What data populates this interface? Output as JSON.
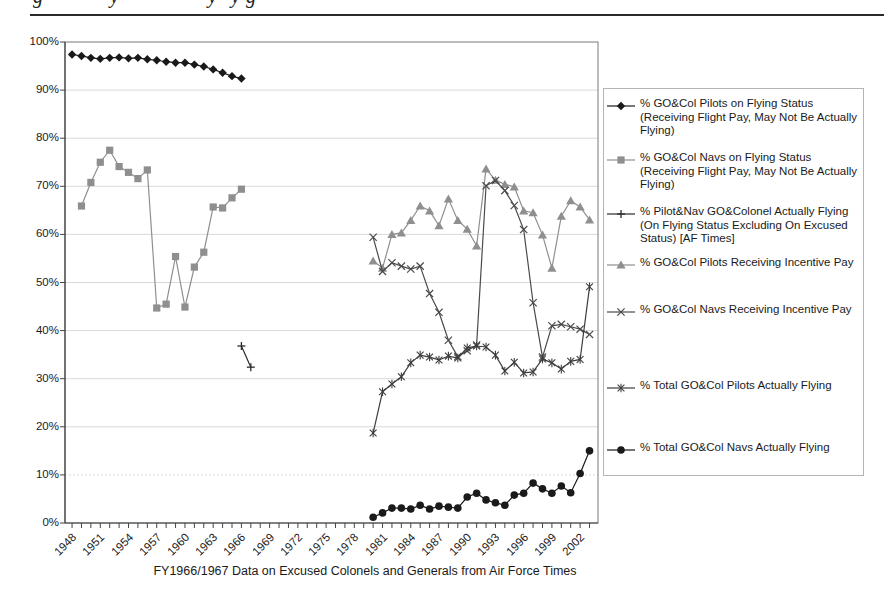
{
  "header": {
    "fragments": [
      {
        "char": "g",
        "x": 33
      },
      {
        "char": "y",
        "x": 110
      },
      {
        "char": "y",
        "x": 208
      },
      {
        "char": "y",
        "x": 231
      },
      {
        "char": "g",
        "x": 246
      }
    ]
  },
  "chart_data": {
    "type": "line",
    "title": "",
    "xlabel": "FY1966/1967 Data on Excused Colonels and Generals from Air Force Times",
    "ylabel": "",
    "ylim": [
      0,
      100
    ],
    "xlim": [
      1947.25,
      2003.9
    ],
    "grid": "horizontal, light gray, dotted at 10%",
    "legend_position": "right",
    "y_tick_step": 10,
    "y_tick_labels": [
      "0%",
      "10%",
      "20%",
      "30%",
      "40%",
      "50%",
      "60%",
      "70%",
      "80%",
      "90%",
      "100%"
    ],
    "x_tick_labels": [
      "1948",
      "1951",
      "1954",
      "1957",
      "1960",
      "1963",
      "1966",
      "1969",
      "1972",
      "1975",
      "1978",
      "1981",
      "1984",
      "1987",
      "1990",
      "1993",
      "1996",
      "1999",
      "2002"
    ],
    "series": [
      {
        "name": "% GO&Col Pilots on Flying Status (Receiving Flight Pay, May Not Be Actually Flying)",
        "marker": "diamond",
        "color": "#1a1a1a",
        "x": [
          1948,
          1949,
          1950,
          1951,
          1952,
          1953,
          1954,
          1955,
          1956,
          1957,
          1958,
          1959,
          1960,
          1961,
          1962,
          1963,
          1964,
          1965,
          1966
        ],
        "y": [
          97.4,
          97.1,
          96.7,
          96.5,
          96.7,
          96.8,
          96.6,
          96.7,
          96.4,
          96.2,
          95.9,
          95.7,
          95.7,
          95.3,
          94.9,
          94.3,
          93.6,
          92.9,
          92.4
        ]
      },
      {
        "name": "% GO&Col Navs on Flying Status (Receiving Flight Pay, May Not Be Actually Flying)",
        "marker": "square",
        "color": "#8f8f8f",
        "x": [
          1949,
          1950,
          1951,
          1952,
          1953,
          1954,
          1955,
          1956,
          1957,
          1958,
          1959,
          1960,
          1961,
          1962,
          1963,
          1964,
          1965,
          1966
        ],
        "y": [
          65.9,
          70.8,
          75.0,
          77.5,
          74.1,
          72.9,
          71.6,
          73.4,
          44.7,
          45.5,
          55.4,
          44.9,
          53.2,
          56.3,
          65.7,
          65.5,
          67.6,
          69.4
        ]
      },
      {
        "name": "% Pilot&Nav GO&Colonel Actually Flying (On Flying Status Excluding On Excused Status) [AF Times]",
        "marker": "plus",
        "color": "#2b2b2b",
        "x": [
          1966,
          1967
        ],
        "y": [
          36.8,
          32.4
        ]
      },
      {
        "name": "% GO&Col Pilots Receiving Incentive Pay",
        "marker": "triangle",
        "color": "#8f8f8f",
        "x": [
          1980,
          1981,
          1982,
          1983,
          1984,
          1985,
          1986,
          1987,
          1988,
          1989,
          1990,
          1991,
          1992,
          1993,
          1994,
          1995,
          1996,
          1997,
          1998,
          1999,
          2000,
          2001,
          2002,
          2003
        ],
        "y": [
          54.5,
          53.0,
          60.0,
          60.3,
          62.9,
          65.9,
          64.9,
          61.8,
          67.4,
          62.9,
          61.1,
          57.6,
          73.6,
          71.3,
          70.4,
          69.9,
          64.9,
          64.5,
          59.9,
          53.0,
          63.8,
          67.0,
          65.7,
          63.0
        ]
      },
      {
        "name": "% GO&Col Navs Receiving Incentive Pay",
        "marker": "x",
        "color": "#4a4a4a",
        "x": [
          1980,
          1981,
          1982,
          1983,
          1984,
          1985,
          1986,
          1987,
          1988,
          1989,
          1990,
          1991,
          1992,
          1993,
          1994,
          1995,
          1996,
          1997,
          1998,
          1999,
          2000,
          2001,
          2002,
          2003
        ],
        "y": [
          59.4,
          52.3,
          54.1,
          53.4,
          52.8,
          53.4,
          47.7,
          43.8,
          38.0,
          34.6,
          35.8,
          37.0,
          70.1,
          71.2,
          69.1,
          66.0,
          61.0,
          45.8,
          34.5,
          41.0,
          41.3,
          40.8,
          40.3,
          39.2
        ]
      },
      {
        "name": "% Total GO&Col Pilots Actually Flying",
        "marker": "asterisk",
        "color": "#3d3d3d",
        "x": [
          1980,
          1981,
          1982,
          1983,
          1984,
          1985,
          1986,
          1987,
          1988,
          1989,
          1990,
          1991,
          1992,
          1993,
          1994,
          1995,
          1996,
          1997,
          1998,
          1999,
          2000,
          2001,
          2002,
          2003
        ],
        "y": [
          18.7,
          27.3,
          28.9,
          30.4,
          33.3,
          34.9,
          34.5,
          33.9,
          34.7,
          34.3,
          36.4,
          36.8,
          36.6,
          34.9,
          31.6,
          33.4,
          31.2,
          31.4,
          34.1,
          33.3,
          32.0,
          33.6,
          34.0,
          49.1
        ]
      },
      {
        "name": "% Total GO&Col Navs Actually Flying",
        "marker": "circle",
        "color": "#1a1a1a",
        "x": [
          1980,
          1981,
          1982,
          1983,
          1984,
          1985,
          1986,
          1987,
          1988,
          1989,
          1990,
          1991,
          1992,
          1993,
          1994,
          1995,
          1996,
          1997,
          1998,
          1999,
          2000,
          2001,
          2002,
          2003
        ],
        "y": [
          1.2,
          2.1,
          3.1,
          3.1,
          2.9,
          3.7,
          2.9,
          3.5,
          3.3,
          3.1,
          5.4,
          6.2,
          4.8,
          4.2,
          3.7,
          5.8,
          6.2,
          8.3,
          7.1,
          6.2,
          7.7,
          6.3,
          10.3,
          15.0
        ]
      }
    ]
  }
}
